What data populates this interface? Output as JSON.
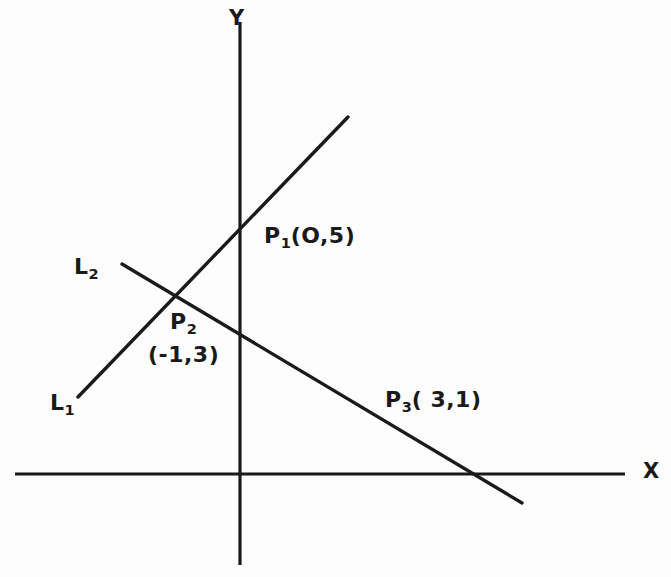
{
  "figure": {
    "background_color": "#fdfdfd",
    "ink_color": "#1a1a1a"
  },
  "axes": {
    "x_label": "X",
    "y_label": "Y",
    "x_axis": {
      "x1": 15,
      "y1": 474,
      "x2": 625,
      "y2": 474
    },
    "y_axis": {
      "x1": 240,
      "y1": 22,
      "x2": 240,
      "y2": 565
    },
    "origin": {
      "x": 240,
      "y": 474
    }
  },
  "lines": [
    {
      "name": "L1",
      "label": "L",
      "subscript": "1",
      "x1": 78,
      "y1": 397,
      "x2": 348,
      "y2": 117
    },
    {
      "name": "L2",
      "label": "L",
      "subscript": "2",
      "x1": 122,
      "y1": 264,
      "x2": 522,
      "y2": 503
    }
  ],
  "point_labels": [
    {
      "name": "P1",
      "label": "P",
      "subscript": "1",
      "coords": "(O,5)"
    },
    {
      "name": "P2",
      "label": "P",
      "subscript": "2",
      "coords": "(-1,3)"
    },
    {
      "name": "P3",
      "label": "P",
      "subscript": "3",
      "coords": "( 3,1)"
    }
  ],
  "labels": {
    "p1_text": "(O,5)",
    "p2_coords": "(-1,3)",
    "p3_text": "( 3,1)",
    "l1_base": "L",
    "l1_sub": "1",
    "l2_base": "L",
    "l2_sub": "2",
    "p1_base": "P",
    "p1_sub": "1",
    "p2_base": "P",
    "p2_sub": "2",
    "p3_base": "P",
    "p3_sub": "3"
  },
  "chart_data": {
    "type": "line",
    "xlabel": "X",
    "ylabel": "Y",
    "grid": false,
    "legend": "inline-annotations",
    "series": [
      {
        "name": "L1",
        "points": [
          {
            "label": "P2",
            "x": -1,
            "y": 3
          },
          {
            "label": "P1",
            "x": 0,
            "y": 5
          }
        ]
      },
      {
        "name": "L2",
        "points": [
          {
            "label": "P2",
            "x": -1,
            "y": 3
          },
          {
            "label": "P3",
            "x": 3,
            "y": 1
          }
        ]
      }
    ],
    "annotations": [
      {
        "text": "P1(O,5)",
        "x": 0,
        "y": 5
      },
      {
        "text": "P2 (-1,3)",
        "x": -1,
        "y": 3
      },
      {
        "text": "P3( 3,1)",
        "x": 3,
        "y": 1
      },
      {
        "text": "L1"
      },
      {
        "text": "L2"
      }
    ]
  }
}
